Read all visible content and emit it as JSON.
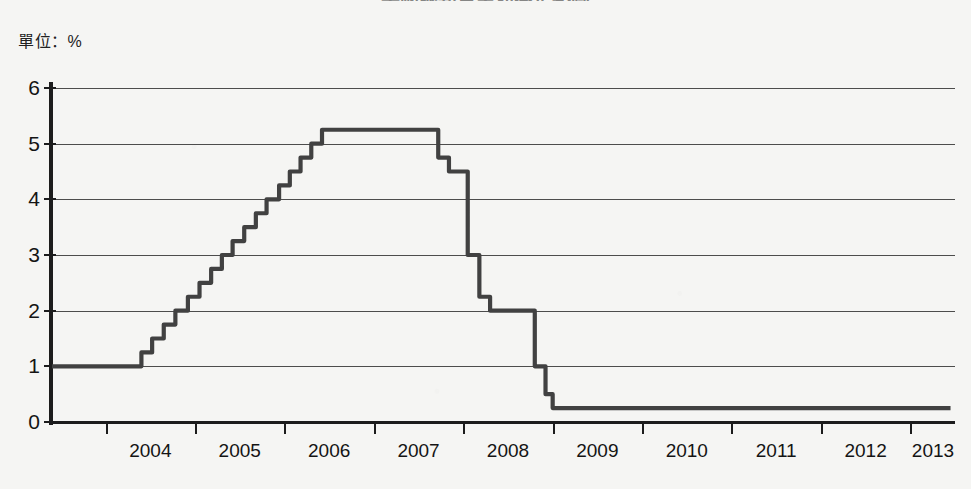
{
  "title": "美國聯邦資金利率走勢圖",
  "unit_label": "單位：%",
  "axis": {
    "y_ticks": [
      "0",
      "1",
      "2",
      "3",
      "4",
      "5",
      "6"
    ],
    "x_ticks": [
      "2004",
      "2005",
      "2006",
      "2007",
      "2008",
      "2009",
      "2010",
      "2011",
      "2012",
      "2013"
    ]
  },
  "colors": {
    "line": "#414141",
    "grid": "#4c4c4c",
    "axis": "#1c1c1c",
    "background": "#f5f5f3"
  },
  "chart_data": {
    "type": "line",
    "title": "美國聯邦資金利率走勢圖",
    "xlabel": "",
    "ylabel": "單位：%",
    "ylim": [
      0,
      6
    ],
    "xlim": [
      2003.4,
      2013.5
    ],
    "grid": true,
    "legend": null,
    "series": [
      {
        "name": "聯邦資金利率",
        "step": "post",
        "x": [
          2003.4,
          2004.3,
          2004.4,
          2004.52,
          2004.65,
          2004.78,
          2004.92,
          2005.05,
          2005.18,
          2005.3,
          2005.42,
          2005.55,
          2005.68,
          2005.8,
          2005.94,
          2006.06,
          2006.18,
          2006.3,
          2006.42,
          2006.5,
          2007.6,
          2007.72,
          2007.84,
          2007.96,
          2008.05,
          2008.18,
          2008.3,
          2008.42,
          2008.55,
          2008.7,
          2008.8,
          2008.92,
          2009.0,
          2013.45
        ],
        "y": [
          1.0,
          1.0,
          1.25,
          1.5,
          1.75,
          2.0,
          2.25,
          2.5,
          2.75,
          3.0,
          3.25,
          3.5,
          3.75,
          4.0,
          4.25,
          4.5,
          4.75,
          5.0,
          5.25,
          5.25,
          5.25,
          4.75,
          4.5,
          4.5,
          3.0,
          2.25,
          2.0,
          2.0,
          2.0,
          2.0,
          1.0,
          0.5,
          0.25,
          0.25
        ],
        "annotations": [
          {
            "label": "低點",
            "value": 1.0,
            "period": "2003–2004 年中"
          },
          {
            "label": "高原期",
            "value": 5.25,
            "period": "2006 年中–2007 年中"
          },
          {
            "label": "金融海嘯後低點",
            "value": 0.25,
            "period": "2009–2013"
          }
        ]
      }
    ]
  }
}
